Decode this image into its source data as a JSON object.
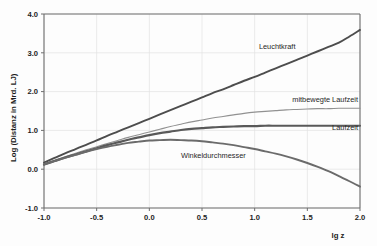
{
  "chart_data": {
    "type": "line",
    "title": "",
    "xlabel": "lg z",
    "ylabel": "Log (Distanz in Mrd. LJ)",
    "xlim": [
      -1.0,
      2.0
    ],
    "ylim": [
      -1.0,
      4.0
    ],
    "xticks": [
      "-1.0",
      "-0.5",
      "0.0",
      "0.5",
      "1.0",
      "1.5",
      "2.0"
    ],
    "xtick_values": [
      -1.0,
      -0.5,
      0.0,
      0.5,
      1.0,
      1.5,
      2.0
    ],
    "yticks": [
      "-1.0",
      "0.0",
      "1.0",
      "2.0",
      "3.0",
      "4.0"
    ],
    "ytick_values": [
      -1.0,
      0.0,
      1.0,
      2.0,
      3.0,
      4.0
    ],
    "grid": "horizontal-and-vertical-light",
    "legend_position": "inline-curve-labels",
    "x": [
      -1.0,
      -0.9,
      -0.8,
      -0.7,
      -0.6,
      -0.5,
      -0.4,
      -0.3,
      -0.2,
      -0.1,
      0.0,
      0.1,
      0.2,
      0.3,
      0.4,
      0.5,
      0.6,
      0.7,
      0.8,
      0.9,
      1.0,
      1.1,
      1.2,
      1.3,
      1.4,
      1.5,
      1.6,
      1.7,
      1.8,
      1.9,
      2.0
    ],
    "series": [
      {
        "name": "Leuchtkraft",
        "color": "#4d4d4d",
        "width": 1.9,
        "label_x": 1.04,
        "label_y": 3.11,
        "values": [
          0.17,
          0.29,
          0.41,
          0.52,
          0.63,
          0.74,
          0.86,
          0.97,
          1.08,
          1.19,
          1.3,
          1.41,
          1.52,
          1.63,
          1.74,
          1.85,
          1.96,
          2.06,
          2.17,
          2.28,
          2.38,
          2.49,
          2.6,
          2.71,
          2.82,
          2.93,
          3.04,
          3.15,
          3.26,
          3.42,
          3.59
        ]
      },
      {
        "name": "mitbewegte Laufzeit",
        "color": "#919191",
        "width": 1.1,
        "label_x": 1.18,
        "label_y": 1.72,
        "values": [
          0.14,
          0.23,
          0.32,
          0.41,
          0.5,
          0.58,
          0.66,
          0.74,
          0.82,
          0.89,
          0.96,
          1.03,
          1.1,
          1.16,
          1.22,
          1.27,
          1.32,
          1.36,
          1.4,
          1.44,
          1.47,
          1.49,
          1.51,
          1.53,
          1.54,
          1.55,
          1.56,
          1.56,
          1.57,
          1.57,
          1.57
        ]
      },
      {
        "name": "Laufzeit",
        "color": "#595959",
        "width": 2.2,
        "label_x": 1.6,
        "label_y": 1.01,
        "values": [
          0.12,
          0.21,
          0.3,
          0.38,
          0.46,
          0.54,
          0.62,
          0.69,
          0.76,
          0.82,
          0.88,
          0.93,
          0.97,
          1.01,
          1.04,
          1.06,
          1.08,
          1.09,
          1.1,
          1.11,
          1.11,
          1.12,
          1.12,
          1.12,
          1.12,
          1.12,
          1.12,
          1.12,
          1.12,
          1.12,
          1.12
        ]
      },
      {
        "name": "Winkeldurchmesser",
        "color": "#6b6b6b",
        "width": 1.9,
        "label_x": 0.3,
        "label_y": 0.29,
        "values": [
          0.12,
          0.21,
          0.29,
          0.37,
          0.45,
          0.52,
          0.58,
          0.63,
          0.68,
          0.71,
          0.74,
          0.75,
          0.76,
          0.75,
          0.74,
          0.72,
          0.69,
          0.66,
          0.62,
          0.57,
          0.52,
          0.46,
          0.4,
          0.33,
          0.25,
          0.16,
          0.06,
          -0.05,
          -0.18,
          -0.31,
          -0.45
        ]
      }
    ]
  }
}
